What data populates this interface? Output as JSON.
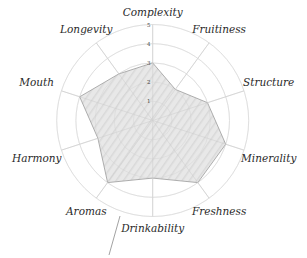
{
  "chart_data": {
    "type": "radar",
    "title": "",
    "categories": [
      "Complexity",
      "Fruitiness",
      "Structure",
      "Minerality",
      "Freshness",
      "Drinkability",
      "Aromas",
      "Harmony",
      "Mouth",
      "Longevity"
    ],
    "series": [
      {
        "name": "",
        "values": [
          3,
          2,
          3,
          4,
          4,
          3,
          4,
          3,
          4,
          3
        ]
      }
    ],
    "rlim": [
      0,
      5
    ],
    "rticks": [
      "1",
      "2",
      "3",
      "4",
      "5"
    ],
    "grid": true,
    "legend": null,
    "colors": {
      "fill": "#d9d9d9",
      "stroke": "#9a9a9a",
      "grid": "#e6e6e6",
      "axis": "#dcdcdc",
      "annotation_line": "#8a8a8a"
    }
  }
}
